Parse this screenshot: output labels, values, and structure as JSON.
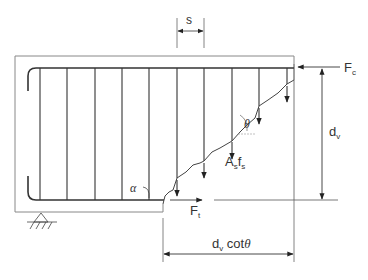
{
  "diagram": {
    "labels": {
      "spacing": "s",
      "compression_force": "F",
      "compression_force_sub": "c",
      "depth": "d",
      "depth_sub": "v",
      "tension_force": "F",
      "tension_force_sub": "t",
      "stirrup_force": "A",
      "stirrup_force_sub1": "s",
      "stirrup_force_f": "f",
      "stirrup_force_sub2": "s",
      "horizontal_projection": "d",
      "horizontal_projection_sub": "v",
      "horizontal_projection_tail": " cot",
      "theta": "θ",
      "alpha": "α"
    },
    "stirrup_count": 10,
    "colors": {
      "line": "#333333",
      "outline": "#888888"
    }
  }
}
